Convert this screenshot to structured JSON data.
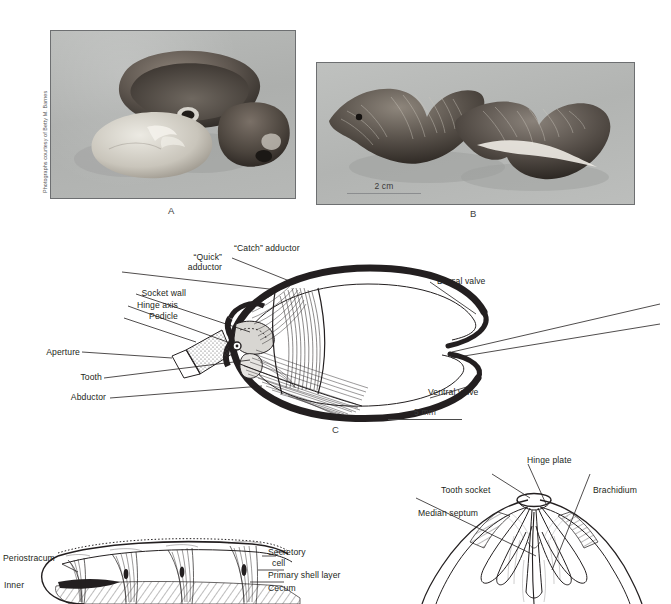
{
  "figure": {
    "background": "#ffffff",
    "ink": "#231f20"
  },
  "panels": [
    {
      "id": "A",
      "letter": "A",
      "kind": "photograph",
      "caption": "Photograph of three brachiopod shells (disarticulated valves)",
      "credit": "Photographs courtesy of Betty M. Barnes"
    },
    {
      "id": "B",
      "letter": "B",
      "kind": "photograph",
      "caption": "Photograph of two ribbed brachiopod shells in anterior view",
      "scale_bar": "2 cm"
    },
    {
      "id": "C",
      "letter": "C",
      "kind": "line-diagram",
      "caption": "Sagittal section of an articulate brachiopod showing musculature",
      "scale_bar": "5 mm",
      "labels": [
        {
          "id": "quick-adductor",
          "text": "“Quick”\nadductor"
        },
        {
          "id": "catch-adductor",
          "text": "“Catch” adductor"
        },
        {
          "id": "socket-wall",
          "text": "Socket wall"
        },
        {
          "id": "hinge-axis",
          "text": "Hinge axis"
        },
        {
          "id": "pedicle",
          "text": "Pedicle"
        },
        {
          "id": "aperture",
          "text": "Aperture"
        },
        {
          "id": "tooth",
          "text": "Tooth"
        },
        {
          "id": "abductor",
          "text": "Abductor"
        },
        {
          "id": "dorsal-valve",
          "text": "Dorsal valve"
        },
        {
          "id": "ventral-valve",
          "text": "Ventral valve"
        }
      ]
    },
    {
      "id": "D",
      "letter": "",
      "kind": "line-diagram",
      "caption": "Detail of shell wall structure with caeca",
      "labels": [
        {
          "id": "periostracum",
          "text": "Periostracum"
        },
        {
          "id": "inner",
          "text": "Inner"
        },
        {
          "id": "secretory-cell-1",
          "text": "Secretory"
        },
        {
          "id": "secretory-cell-2",
          "text": "cell"
        },
        {
          "id": "primary-shell-layer",
          "text": "Primary shell layer"
        },
        {
          "id": "cecum",
          "text": "Cecum"
        }
      ]
    },
    {
      "id": "E",
      "letter": "",
      "kind": "line-diagram",
      "caption": "Interior of dorsal valve showing brachidium and hinge structures",
      "labels": [
        {
          "id": "hinge-plate",
          "text": "Hinge plate"
        },
        {
          "id": "tooth-socket",
          "text": "Tooth socket"
        },
        {
          "id": "brachidium",
          "text": "Brachidium"
        },
        {
          "id": "median-septum",
          "text": "Median septum"
        }
      ]
    }
  ],
  "labels": {
    "quick_adductor_l1": "“Quick”",
    "quick_adductor_l2": "adductor",
    "catch_adductor": "“Catch” adductor",
    "socket_wall": "Socket wall",
    "hinge_axis": "Hinge axis",
    "pedicle": "Pedicle",
    "aperture": "Aperture",
    "tooth": "Tooth",
    "abductor": "Abductor",
    "dorsal_valve": "Dorsal valve",
    "ventral_valve": "Ventral valve",
    "periostracum": "Periostracum",
    "inner": "Inner",
    "secretory_l1": "Secretory",
    "secretory_l2": "cell",
    "primary_shell_layer": "Primary shell layer",
    "cecum": "Cecum",
    "hinge_plate": "Hinge plate",
    "tooth_socket": "Tooth socket",
    "brachidium": "Brachidium",
    "median_septum": "Median septum"
  },
  "scales": {
    "panel_b": "2 cm",
    "panel_c": "5 mm"
  },
  "letters": {
    "a": "A",
    "b": "B",
    "c": "C"
  },
  "credit": "Photographs courtesy of Betty M. Barnes"
}
